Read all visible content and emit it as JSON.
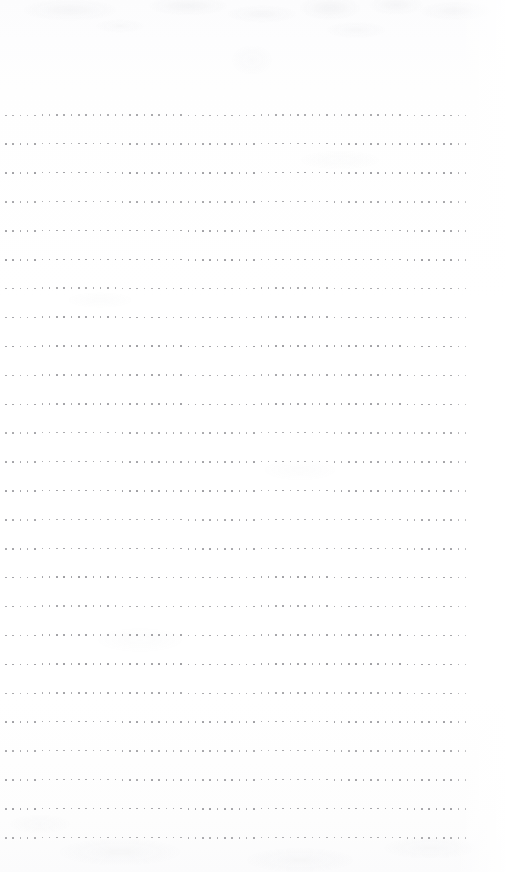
{
  "document": {
    "kind": "scanned-page",
    "page_type": "dot-ruled notebook page",
    "title": "",
    "body_text": "",
    "page_number": "",
    "header_text": "",
    "footer_text": "",
    "handwriting": "",
    "content_note": "blank — no text, figures or annotations present"
  },
  "canvas": {
    "width": 506,
    "height": 872,
    "background_color": "#fefefe",
    "paper_tint_top": "#fcfcfd",
    "paper_tint_bottom": "#fbfbfc",
    "texture_color": "#969aa4"
  },
  "ruling": {
    "style": "dotted",
    "dot_color": "#9b9b9f",
    "dot_size_px": 1.6,
    "dot_pitch_x_px": 7.3,
    "row_count": 26,
    "row_spacing_px": 28.9,
    "first_row_y_px": 115,
    "last_row_y_px": 838,
    "row_start_x_px": 5,
    "row_end_x_px": 471,
    "margin_left_px": 5,
    "margin_right_px": 35,
    "margin_top_px": 115,
    "margin_bottom_px": 34
  },
  "chart_data": {
    "type": "table",
    "title": "",
    "xlabel": "",
    "ylabel": "",
    "categories": [],
    "values": []
  }
}
